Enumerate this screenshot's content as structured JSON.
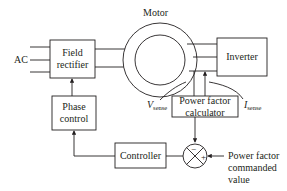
{
  "diagram": {
    "title": "",
    "labels": {
      "ac": "AC",
      "motor": "Motor",
      "field_rectifier_line1": "Field",
      "field_rectifier_line2": "rectifier",
      "inverter": "Inverter",
      "phase_control_line1": "Phase",
      "phase_control_line2": "control",
      "controller": "Controller",
      "pf_calc_line1": "Power factor",
      "pf_calc_line2": "calculator",
      "v_sense_main": "V",
      "v_sense_sub": "sense",
      "i_sense_main": "I",
      "i_sense_sub": "sense",
      "sum_minus": "−",
      "sum_plus": "+",
      "pf_cmd_line1": "Power factor",
      "pf_cmd_line2": "commanded",
      "pf_cmd_line3": "value"
    },
    "nodes": [
      {
        "id": "field_rectifier",
        "label": "Field rectifier"
      },
      {
        "id": "motor",
        "label": "Motor"
      },
      {
        "id": "inverter",
        "label": "Inverter"
      },
      {
        "id": "phase_control",
        "label": "Phase control"
      },
      {
        "id": "pf_calculator",
        "label": "Power factor calculator"
      },
      {
        "id": "summing_junction",
        "label": "− / +"
      },
      {
        "id": "controller",
        "label": "Controller"
      }
    ],
    "edges": [
      {
        "from": "AC",
        "to": "field_rectifier",
        "lines": 3
      },
      {
        "from": "field_rectifier",
        "to": "motor",
        "lines": 2
      },
      {
        "from": "motor",
        "to": "inverter",
        "lines": 3
      },
      {
        "from": "motor",
        "to": "pf_calculator",
        "label": "V_sense"
      },
      {
        "from": "motor",
        "to": "pf_calculator",
        "label": "I_sense"
      },
      {
        "from": "pf_calculator",
        "to": "summing_junction",
        "sign": "-"
      },
      {
        "from": "power_factor_commanded_value",
        "to": "summing_junction",
        "sign": "+"
      },
      {
        "from": "summing_junction",
        "to": "controller"
      },
      {
        "from": "controller",
        "to": "phase_control"
      },
      {
        "from": "phase_control",
        "to": "field_rectifier"
      }
    ]
  }
}
